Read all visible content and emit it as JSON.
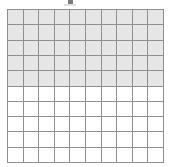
{
  "figure": {
    "kind": "hundred-grid",
    "title": "",
    "columns": 10,
    "rows": 10,
    "total_cells": 100,
    "shaded_cells": 50,
    "unshaded_cells": 50,
    "shaded_rows": 5,
    "unshaded_rows": 5,
    "fraction_label": "50/100",
    "percent_label": "50%",
    "decimal_label": "0.5"
  },
  "colors": {
    "shaded_fill": "#e6e6e6",
    "unshaded_fill": "#ffffff",
    "gridline": "#8f8f8f",
    "page_background": "#ffffff",
    "top_mark": "#5e5e5e"
  },
  "chart_data": {
    "type": "heatmap",
    "title": "",
    "xlabel": "",
    "ylabel": "",
    "grid": true,
    "legend": "none",
    "categories": [
      "c1",
      "c2",
      "c3",
      "c4",
      "c5",
      "c6",
      "c7",
      "c8",
      "c9",
      "c10"
    ],
    "row_labels": [
      "r1",
      "r2",
      "r3",
      "r4",
      "r5",
      "r6",
      "r7",
      "r8",
      "r9",
      "r10"
    ],
    "values": [
      [
        1,
        1,
        1,
        1,
        1,
        1,
        1,
        1,
        1,
        1
      ],
      [
        1,
        1,
        1,
        1,
        1,
        1,
        1,
        1,
        1,
        1
      ],
      [
        1,
        1,
        1,
        1,
        1,
        1,
        1,
        1,
        1,
        1
      ],
      [
        1,
        1,
        1,
        1,
        1,
        1,
        1,
        1,
        1,
        1
      ],
      [
        1,
        1,
        1,
        1,
        1,
        1,
        1,
        1,
        1,
        1
      ],
      [
        0,
        0,
        0,
        0,
        0,
        0,
        0,
        0,
        0,
        0
      ],
      [
        0,
        0,
        0,
        0,
        0,
        0,
        0,
        0,
        0,
        0
      ],
      [
        0,
        0,
        0,
        0,
        0,
        0,
        0,
        0,
        0,
        0
      ],
      [
        0,
        0,
        0,
        0,
        0,
        0,
        0,
        0,
        0,
        0
      ],
      [
        0,
        0,
        0,
        0,
        0,
        0,
        0,
        0,
        0,
        0
      ]
    ],
    "value_map": {
      "1": "shaded",
      "0": "unshaded"
    },
    "shaded_count": 50,
    "total": 100
  }
}
